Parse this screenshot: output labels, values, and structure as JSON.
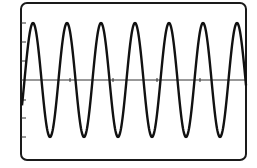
{
  "figure": {
    "colors": {
      "background": "#ffffff",
      "trace": "#111111",
      "frame": "#1a1a1a",
      "axis": "#333333"
    }
  },
  "chart_data": {
    "type": "line",
    "title": "",
    "xlabel": "",
    "ylabel": "",
    "waveform": "sine",
    "cycles_visible": 6.5,
    "period_px": 34,
    "amplitude_px": 57,
    "baseline_y_px": 80,
    "peaks_x_px": [
      33,
      67,
      101,
      135,
      169,
      203,
      236
    ],
    "troughs_x_px": [
      50,
      84,
      118,
      152,
      186,
      220
    ],
    "y_axis_ticks_y_px": [
      23,
      42,
      61,
      100,
      118,
      137
    ],
    "x_axis_ticks_x_px": [
      70,
      113,
      157,
      200
    ],
    "grid": false,
    "legend": null
  }
}
